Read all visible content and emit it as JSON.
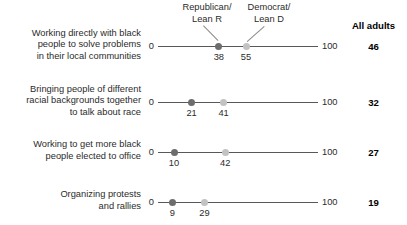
{
  "header": {
    "group_labels": [
      {
        "name": "republican",
        "line1": "Republican/",
        "line2": "Lean R"
      },
      {
        "name": "democrat",
        "line1": "Democrat/",
        "line2": "Lean D"
      }
    ],
    "all_adults_label": "All adults"
  },
  "axis": {
    "min_label": "0",
    "max_label": "100"
  },
  "rows": [
    {
      "label_lines": [
        "Working directly with black",
        "people to solve problems",
        "in their local communities"
      ],
      "republican": 38,
      "democrat": 55,
      "all_adults": 46,
      "republican_label": "38",
      "democrat_label": "55",
      "all_adults_label": "46"
    },
    {
      "label_lines": [
        "Bringing people of different",
        "racial backgrounds together",
        "to talk about race"
      ],
      "republican": 21,
      "democrat": 41,
      "all_adults": 32,
      "republican_label": "21",
      "democrat_label": "41",
      "all_adults_label": "32"
    },
    {
      "label_lines": [
        "Working to get more black",
        "people elected to office"
      ],
      "republican": 10,
      "democrat": 42,
      "all_adults": 27,
      "republican_label": "10",
      "democrat_label": "42",
      "all_adults_label": "27"
    },
    {
      "label_lines": [
        "Organizing protests",
        "and rallies"
      ],
      "republican": 9,
      "democrat": 29,
      "all_adults": 19,
      "republican_label": "9",
      "democrat_label": "29",
      "all_adults_label": "19"
    }
  ],
  "colors": {
    "republican_dot": "#6d6d6d",
    "democrat_dot": "#c2c2c2",
    "axis": "#585858",
    "text": "#2b2b2b"
  },
  "chart_data": {
    "type": "scatter",
    "subtype": "dot-plot-dumbbell",
    "title": "",
    "xlabel": "",
    "ylabel": "",
    "xlim": [
      0,
      100
    ],
    "grid": false,
    "legend_position": "top",
    "tick_labels": [
      "0",
      "100"
    ],
    "categories": [
      "Working directly with black people to solve problems in their local communities",
      "Bringing people of different racial backgrounds together to talk about race",
      "Working to get more black people elected to office",
      "Organizing protests and rallies"
    ],
    "series": [
      {
        "name": "Republican/Lean R",
        "values": [
          38,
          21,
          10,
          9
        ],
        "color": "#6d6d6d"
      },
      {
        "name": "Democrat/Lean D",
        "values": [
          55,
          41,
          42,
          29
        ],
        "color": "#c2c2c2"
      },
      {
        "name": "All adults",
        "values": [
          46,
          32,
          27,
          19
        ],
        "display": "text-column"
      }
    ]
  },
  "layout": {
    "axis_x_start": 158,
    "axis_x_end": 318,
    "row_y": [
      46,
      102,
      152,
      202
    ]
  }
}
